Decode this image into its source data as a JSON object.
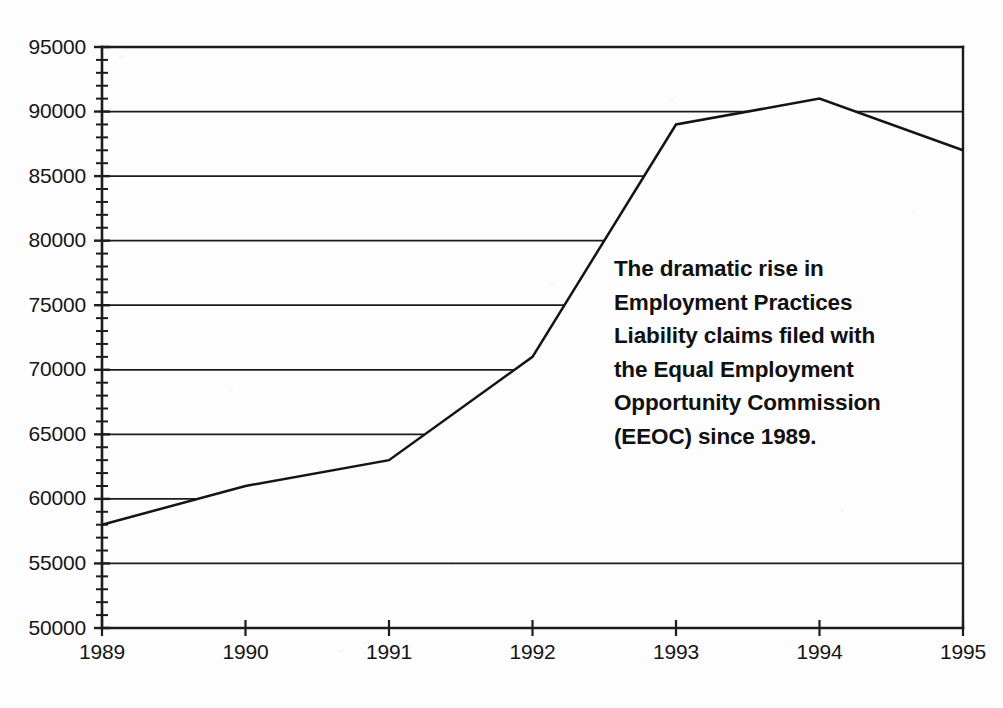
{
  "chart_data": {
    "type": "line",
    "title": "",
    "subtitle": "",
    "xlabel": "",
    "ylabel": "",
    "categories": [
      "1989",
      "1990",
      "1991",
      "1992",
      "1993",
      "1994",
      "1995"
    ],
    "x": [
      1989,
      1990,
      1991,
      1992,
      1993,
      1994,
      1995
    ],
    "values": [
      58000,
      61000,
      63000,
      71000,
      89000,
      91000,
      87000
    ],
    "series": [
      {
        "name": "EEOC claims filed",
        "values": [
          58000,
          61000,
          63000,
          71000,
          89000,
          91000,
          87000
        ]
      }
    ],
    "ylim": [
      50000,
      95000
    ],
    "xlim": [
      1989,
      1995
    ],
    "ytick_labels": [
      "50000",
      "55000",
      "60000",
      "65000",
      "70000",
      "75000",
      "80000",
      "85000",
      "90000",
      "95000"
    ],
    "ytick_values": [
      50000,
      55000,
      60000,
      65000,
      70000,
      75000,
      80000,
      85000,
      90000,
      95000
    ],
    "ytick_step": 5000,
    "yminor_step": 1000,
    "xtick_labels": [
      "1989",
      "1990",
      "1991",
      "1992",
      "1993",
      "1994",
      "1995"
    ],
    "grid": "horizontal",
    "grid_clipped_at_series": true,
    "legend": "none",
    "legend_position": "none",
    "line_color": "#141414",
    "axis_color": "#1c1c1c",
    "background_color": "#ffffff",
    "annotations": [
      {
        "name": "chart-annotation",
        "lines": [
          "The dramatic rise in",
          "Employment Practices",
          "Liability claims filed with",
          "the Equal Employment",
          "Opportunity Commission",
          "(EEOC) since 1989."
        ],
        "text": "The dramatic rise in Employment Practices Liability claims filed with the Equal Employment Opportunity Commission (EEOC) since 1989.",
        "bold": true
      }
    ]
  }
}
